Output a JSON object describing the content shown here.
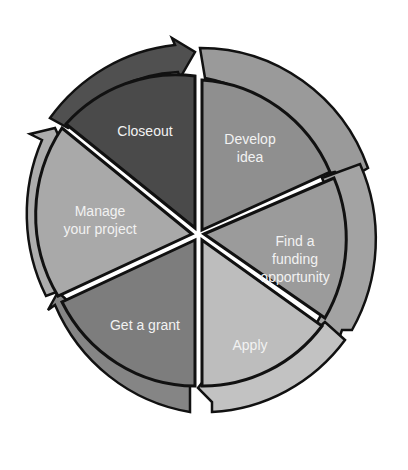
{
  "diagram": {
    "type": "cycle",
    "segments": [
      {
        "id": "develop-idea",
        "label": "Develop\nidea",
        "color": "#8f8f8f"
      },
      {
        "id": "find-funding",
        "label": "Find a\nfunding\nopportunity",
        "color": "#999999"
      },
      {
        "id": "apply",
        "label": "Apply",
        "color": "#bdbdbd"
      },
      {
        "id": "get-grant",
        "label": "Get a grant",
        "color": "#7d7d7d"
      },
      {
        "id": "manage-project",
        "label": "Manage\nyour project",
        "color": "#a8a8a8"
      },
      {
        "id": "closeout",
        "label": "Closeout",
        "color": "#4a4a4a"
      }
    ],
    "outline_color": "#111111"
  }
}
